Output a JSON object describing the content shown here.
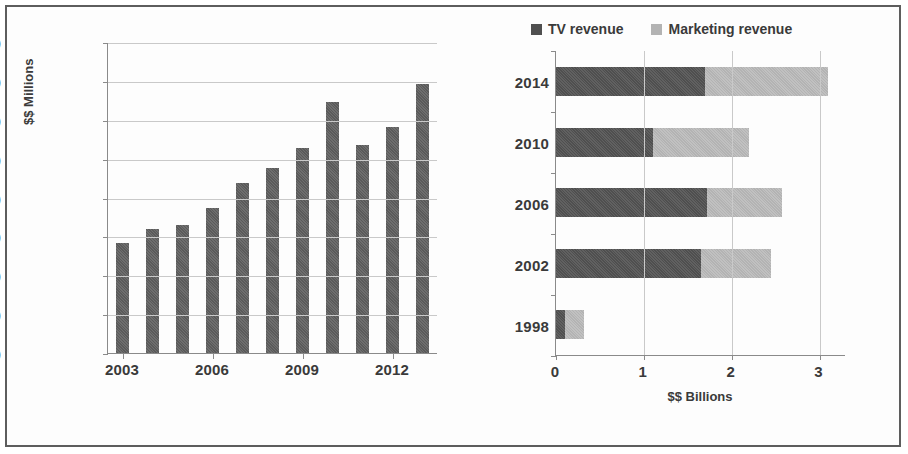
{
  "chart_data": [
    {
      "type": "bar",
      "title": "",
      "xlabel": "",
      "ylabel": "$$ Millions",
      "orientation": "vertical",
      "grid": true,
      "legend": "none",
      "ylim": [
        0,
        1600
      ],
      "yticks": [
        0,
        200,
        400,
        600,
        800,
        1000,
        1200,
        1400,
        1600
      ],
      "xticks_shown": [
        "2003",
        "2006",
        "2009",
        "2012"
      ],
      "categories": [
        "2003",
        "2004",
        "2005",
        "2006",
        "2007",
        "2008",
        "2009",
        "2010",
        "2011",
        "2012",
        "2013"
      ],
      "values": [
        565,
        640,
        660,
        745,
        875,
        950,
        1055,
        1290,
        1070,
        1165,
        1385
      ],
      "bar_color": "#5a5a5a"
    },
    {
      "type": "bar",
      "title": "",
      "xlabel": "$$ Billions",
      "ylabel": "",
      "orientation": "horizontal",
      "stacked": true,
      "grid": true,
      "legend": "top",
      "xlim": [
        0,
        3.3
      ],
      "xticks": [
        0,
        1,
        2,
        3
      ],
      "categories": [
        "2014",
        "2010",
        "2006",
        "2002",
        "1998"
      ],
      "series": [
        {
          "name": "TV revenue",
          "color": "#4f4f4f",
          "values": [
            1.7,
            1.1,
            1.72,
            1.65,
            0.1
          ]
        },
        {
          "name": "Marketing revenue",
          "color": "#b3b3b3",
          "values": [
            1.4,
            1.1,
            0.85,
            0.8,
            0.22
          ]
        }
      ],
      "totals": [
        3.1,
        2.2,
        2.57,
        2.45,
        0.32
      ]
    }
  ],
  "left_chart": {
    "ylabel": "$$ Millions",
    "yticks": [
      "0",
      "200",
      "400",
      "600",
      "800",
      "1000",
      "1200",
      "1400",
      "1600"
    ],
    "xticks": [
      "2003",
      "2006",
      "2009",
      "2012"
    ]
  },
  "right_chart": {
    "xlabel": "$$ Billions",
    "xticks": [
      "0",
      "1",
      "2",
      "3"
    ],
    "yticks": [
      "2014",
      "2010",
      "2006",
      "2002",
      "1998"
    ],
    "legend": [
      {
        "label": "TV revenue",
        "color": "#4f4f4f"
      },
      {
        "label": "Marketing revenue",
        "color": "#b3b3b3"
      }
    ]
  }
}
